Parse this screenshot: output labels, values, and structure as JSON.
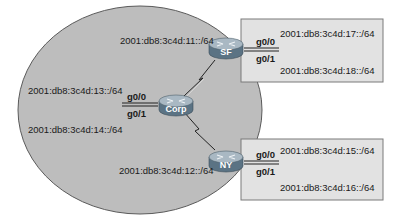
{
  "diagram": {
    "type": "network-topology",
    "colors": {
      "wan_cloud_fill": "#bdbdbd",
      "wan_cloud_stroke": "#5a5a5a",
      "lan_box_fill": "#e2e2e2",
      "lan_box_stroke": "#7a7a7a",
      "router_body": "#5b7384",
      "router_top": "#9fb0bc",
      "text": "#1a1a1a"
    },
    "routers": [
      {
        "id": "corp",
        "label": "Corp"
      },
      {
        "id": "sf",
        "label": "SF"
      },
      {
        "id": "ny",
        "label": "NY"
      }
    ],
    "serial_links": [
      {
        "from": "Corp",
        "to": "SF",
        "subnet": "2001:db8:3c4d:11::/64"
      },
      {
        "from": "Corp",
        "to": "NY",
        "subnet": "2001:db8:3c4d:12::/64"
      }
    ],
    "corp": {
      "g0_0": {
        "interface": "g0/0",
        "subnet": "2001:db8:3c4d:13::/64"
      },
      "g0_1": {
        "interface": "g0/1",
        "subnet": "2001:db8:3c4d:14::/64"
      }
    },
    "sf": {
      "g0_0": {
        "interface": "g0/0",
        "subnet": "2001:db8:3c4d:17::/64"
      },
      "g0_1": {
        "interface": "g0/1",
        "subnet": "2001:db8:3c4d:18::/64"
      }
    },
    "ny": {
      "g0_0": {
        "interface": "g0/0",
        "subnet": "2001:db8:3c4d:15::/64"
      },
      "g0_1": {
        "interface": "g0/1",
        "subnet": "2001:db8:3c4d:16::/64"
      }
    }
  }
}
